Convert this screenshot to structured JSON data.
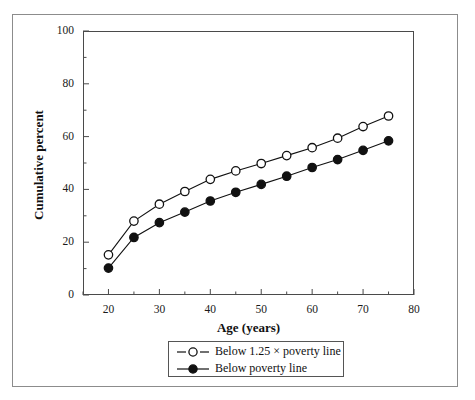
{
  "chart_data": {
    "type": "line",
    "title": "",
    "xlabel": "Age (years)",
    "ylabel": "Cumulative percent",
    "xlim": [
      15,
      80
    ],
    "ylim": [
      0,
      100
    ],
    "x_ticks": [
      20,
      30,
      40,
      50,
      60,
      70,
      80
    ],
    "x_minor_ticks": [
      15,
      25,
      35,
      45,
      55,
      65,
      75
    ],
    "y_ticks": [
      0,
      20,
      40,
      60,
      80,
      100
    ],
    "y_minor_ticks": [
      10,
      30,
      50,
      70,
      90
    ],
    "grid": false,
    "legend_position": "below-axes",
    "x": [
      20,
      25,
      30,
      35,
      40,
      45,
      50,
      55,
      60,
      65,
      70,
      75
    ],
    "series": [
      {
        "name": "Below 1.25 × poverty line",
        "marker": "open-circle",
        "color": "#111111",
        "values": [
          15.2,
          28.0,
          34.4,
          39.2,
          43.8,
          47.0,
          49.8,
          52.8,
          55.8,
          59.4,
          63.8,
          67.8
        ]
      },
      {
        "name": "Below poverty line",
        "marker": "filled-circle",
        "color": "#111111",
        "values": [
          10.2,
          21.8,
          27.4,
          31.4,
          35.6,
          38.9,
          41.9,
          45.0,
          48.3,
          51.3,
          54.8,
          58.4
        ]
      }
    ]
  },
  "axes": {
    "y_tick_labels": [
      "0",
      "20",
      "40",
      "60",
      "80",
      "100"
    ],
    "x_tick_labels": [
      "20",
      "30",
      "40",
      "50",
      "60",
      "70",
      "80"
    ],
    "y_title": "Cumulative percent",
    "x_title": "Age (years)"
  },
  "legend": {
    "items": [
      {
        "label": "Below 1.25 × poverty line",
        "marker": "open-circle"
      },
      {
        "label": "Below poverty line",
        "marker": "filled-circle"
      }
    ]
  },
  "style": {
    "axis_color": "#4a4a4a",
    "frame_color": "#8c8c8c",
    "line_color": "#111111",
    "marker_fill_open": "#ffffff",
    "marker_fill_solid": "#111111",
    "background": "#ffffff"
  }
}
